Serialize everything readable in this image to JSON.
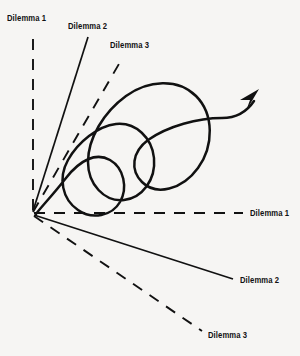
{
  "figure": {
    "background_color": "#f6f5f3",
    "ink_color": "#111111",
    "width": 300,
    "height": 356,
    "origin": {
      "x": 32,
      "y": 213
    }
  },
  "labels": {
    "upper_dilemma_1": "Dilemma 1",
    "upper_dilemma_2": "Dilemma 2",
    "upper_dilemma_3": "Dilemma 3",
    "right_dilemma_1": "Dilemma 1",
    "lower_dilemma_2": "Dilemma 2",
    "lower_dilemma_3": "Dilemma 3"
  },
  "rays": [
    {
      "name": "upper-dilemma-1",
      "label": "Dilemma 1",
      "style": "dashed",
      "direction": "up"
    },
    {
      "name": "upper-dilemma-2",
      "label": "Dilemma 2",
      "style": "solid",
      "direction": "up-right"
    },
    {
      "name": "upper-dilemma-3",
      "label": "Dilemma 3",
      "style": "dashed",
      "direction": "up-right"
    },
    {
      "name": "right-dilemma-1",
      "label": "Dilemma 1",
      "style": "dashed",
      "direction": "right"
    },
    {
      "name": "lower-dilemma-2",
      "label": "Dilemma 2",
      "style": "solid",
      "direction": "down-right"
    },
    {
      "name": "lower-dilemma-3",
      "label": "Dilemma 3",
      "style": "dashed",
      "direction": "down-right"
    }
  ],
  "spiral": {
    "name": "expanding-spiral",
    "loops": 3,
    "direction": "expanding-outward",
    "terminator": "arrowhead",
    "arrow_tip": {
      "x": 258,
      "y": 98
    }
  }
}
